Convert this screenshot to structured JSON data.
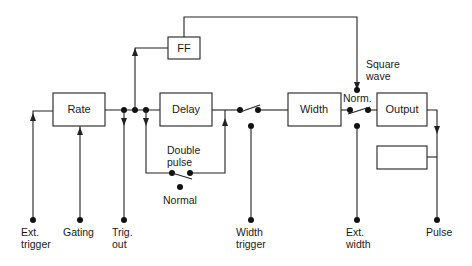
{
  "blocks": {
    "rate": "Rate",
    "ff": "FF",
    "delay": "Delay",
    "width": "Width",
    "output": "Output",
    "unlabeled": ""
  },
  "switch_labels": {
    "double_pulse_line1": "Double",
    "double_pulse_line2": "pulse",
    "normal": "Normal",
    "norm": "Norm.",
    "square_wave_line1": "Square",
    "square_wave_line2": "wave"
  },
  "terminals": [
    {
      "id": "ext_trigger",
      "line1": "Ext.",
      "line2": "trigger"
    },
    {
      "id": "gating",
      "line1": "Gating",
      "line2": ""
    },
    {
      "id": "trig_out",
      "line1": "Trig.",
      "line2": "out"
    },
    {
      "id": "width_trigger",
      "line1": "Width",
      "line2": "trigger"
    },
    {
      "id": "ext_width",
      "line1": "Ext.",
      "line2": "width"
    },
    {
      "id": "pulse",
      "line1": "Pulse",
      "line2": ""
    }
  ]
}
